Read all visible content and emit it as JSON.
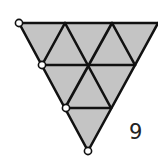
{
  "diagram": {
    "type": "triangular-grid",
    "rows": 3,
    "small_triangles": 9,
    "fill_color": "#c4c4c4",
    "stroke_color": "#111111",
    "marked_vertices": 4,
    "label": "9"
  }
}
